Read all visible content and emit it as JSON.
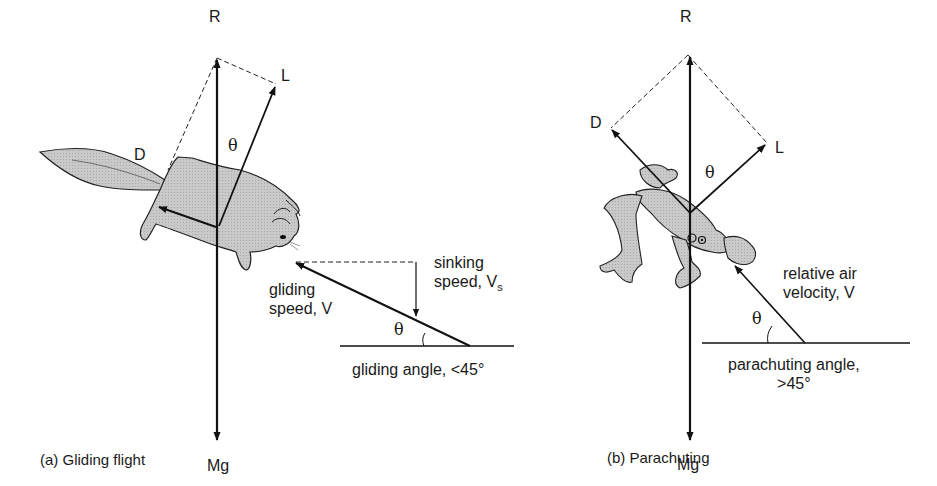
{
  "figure": {
    "panels": [
      {
        "id": "a",
        "caption": "(a) Gliding flight",
        "animal": "flying squirrel",
        "force_labels": {
          "resultant": "R",
          "lift": "L",
          "drag": "D",
          "weight": "Mg",
          "angle": "θ"
        },
        "velocity_triangle": {
          "sinking_line1": "sinking",
          "sinking_line2": "speed, V",
          "sinking_sub": "s",
          "gliding_line1": "gliding",
          "gliding_line2": "speed, V",
          "angle_label": "θ",
          "angle_caption": "gliding angle, <45°"
        }
      },
      {
        "id": "b",
        "caption": "(b) Parachuting",
        "animal": "gliding frog",
        "force_labels": {
          "resultant": "R",
          "lift": "L",
          "drag": "D",
          "weight": "Mg",
          "angle": "θ"
        },
        "velocity_triangle": {
          "air_line1": "relative air",
          "air_line2": "velocity, V",
          "angle_label": "θ",
          "angle_caption_line1": "parachuting angle,",
          "angle_caption_line2": ">45°"
        }
      }
    ]
  }
}
